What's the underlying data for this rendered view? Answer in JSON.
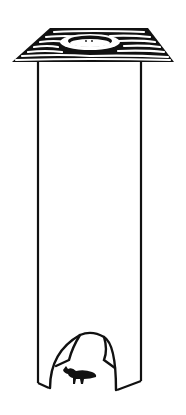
{
  "illustration": {
    "subject": "tall tube trap with wood-grain roof and arched entrance with small animal",
    "colors": {
      "ink": "#111111",
      "background": "#ffffff"
    },
    "roof": {
      "grain_lines": 9,
      "hole": true
    },
    "tube": {
      "left_x": 37,
      "right_x": 141,
      "top_y": 60,
      "bottom_y": 385
    },
    "entrance": {
      "shape": "arch",
      "animal": "small rodent silhouette"
    }
  }
}
